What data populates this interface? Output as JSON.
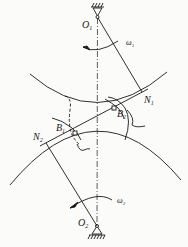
{
  "diagram": {
    "labels": {
      "o1": "O",
      "o1_sub": "1",
      "o2": "O",
      "o2_sub": "2",
      "omega1": "ω",
      "omega1_sub": "1",
      "omega2": "ω",
      "omega2_sub": "2",
      "n1": "N",
      "n1_sub": "1",
      "n2": "N",
      "n2_sub": "2",
      "b1": "B",
      "b1_sub": "1",
      "b2": "B",
      "b2_sub": "2"
    },
    "colors": {
      "ink": "#1a1a1a",
      "background": "#fbfbf9"
    }
  }
}
